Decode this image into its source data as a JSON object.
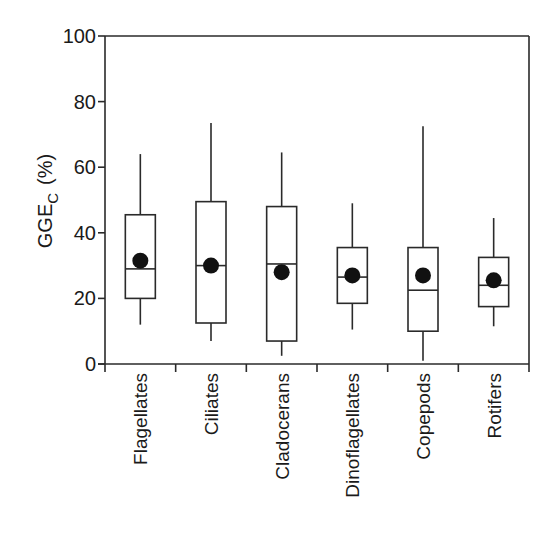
{
  "chart_data": {
    "type": "box",
    "title": "",
    "xlabel": "",
    "ylabel": "GGE",
    "ylabel_subscript": "C",
    "ylabel_suffix": "(%)",
    "ylim": [
      0,
      100
    ],
    "yticks": [
      0,
      20,
      40,
      60,
      80,
      100
    ],
    "grid": false,
    "legend": null,
    "categories": [
      "Flagellates",
      "Ciliates",
      "Cladocerans",
      "Dinoflagellates",
      "Copepods",
      "Rotifers"
    ],
    "series": [
      {
        "name": "Flagellates",
        "whisker_low": 12,
        "q1": 20,
        "median": 29,
        "q3": 45.5,
        "whisker_high": 64,
        "mean": 31.5
      },
      {
        "name": "Ciliates",
        "whisker_low": 7,
        "q1": 12.5,
        "median": 30,
        "q3": 49.5,
        "whisker_high": 73.5,
        "mean": 30
      },
      {
        "name": "Cladocerans",
        "whisker_low": 2.5,
        "q1": 7,
        "median": 30.5,
        "q3": 48,
        "whisker_high": 64.5,
        "mean": 28
      },
      {
        "name": "Dinoflagellates",
        "whisker_low": 10.5,
        "q1": 18.5,
        "median": 26.5,
        "q3": 35.5,
        "whisker_high": 49,
        "mean": 27
      },
      {
        "name": "Copepods",
        "whisker_low": 1,
        "q1": 10,
        "median": 22.5,
        "q3": 35.5,
        "whisker_high": 72.5,
        "mean": 27
      },
      {
        "name": "Rotifers",
        "whisker_low": 11.5,
        "q1": 17.5,
        "median": 24,
        "q3": 32.5,
        "whisker_high": 44.5,
        "mean": 25.5
      }
    ]
  },
  "style": {
    "line_color": "#2a2a2a",
    "mean_marker_color": "#111111",
    "background": "#ffffff"
  }
}
